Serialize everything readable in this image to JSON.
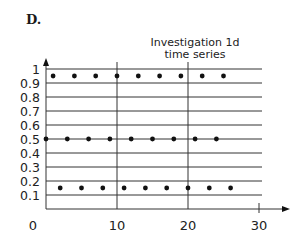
{
  "part_label": "D.",
  "chart_data": {
    "type": "scatter",
    "title": "Investigation 1d",
    "subtitle": "time series",
    "xlabel": "",
    "ylabel": "",
    "xlim": [
      0,
      30
    ],
    "ylim": [
      0,
      1
    ],
    "x_ticks": [
      0,
      10,
      20,
      30
    ],
    "y_ticks": [
      0.1,
      0.2,
      0.3,
      0.4,
      0.5,
      0.6,
      0.7,
      0.8,
      0.9,
      1
    ],
    "y_tick_labels": [
      "0.1",
      "0.2",
      "0.3",
      "0.4",
      "0.5",
      "0.6",
      "0.7",
      "0.8",
      "0.9",
      "1"
    ],
    "grid": {
      "horizontal": true,
      "vertical_at": [
        10,
        20
      ]
    },
    "legend": null,
    "series": [
      {
        "name": "time series",
        "x": [
          0,
          1,
          2,
          3,
          4,
          5,
          6,
          7,
          8,
          9,
          10,
          11,
          12,
          13,
          14,
          15,
          16,
          17,
          18,
          19,
          20,
          21,
          22,
          23,
          24,
          25,
          26
        ],
        "y": [
          0.5,
          0.95,
          0.15,
          0.5,
          0.95,
          0.15,
          0.5,
          0.95,
          0.15,
          0.5,
          0.95,
          0.15,
          0.5,
          0.95,
          0.15,
          0.5,
          0.95,
          0.15,
          0.5,
          0.95,
          0.15,
          0.5,
          0.95,
          0.15,
          0.5,
          0.95,
          0.15
        ]
      }
    ]
  }
}
